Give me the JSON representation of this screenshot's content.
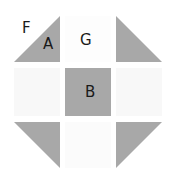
{
  "diagram": {
    "type": "quilt-block",
    "pattern": "shoo-fly",
    "colors": {
      "background": "#ffffff",
      "light_patch": "#f7f7f7",
      "dark_fill": "#a8a8a8",
      "label": "#1a1a1a"
    },
    "pieces": [
      {
        "id": "tl-triangle",
        "points": "14,62 60,16 60,62"
      },
      {
        "id": "tr-triangle",
        "points": "116,16 116,62 162,62"
      },
      {
        "id": "bl-triangle",
        "points": "14,122 60,122 60,168"
      },
      {
        "id": "br-triangle",
        "points": "116,122 162,122 116,168"
      }
    ],
    "center_square": {
      "x": 65,
      "y": 68,
      "w": 46,
      "h": 48
    },
    "labels": {
      "F": "F",
      "A": "A",
      "G": "G",
      "B": "B"
    }
  }
}
